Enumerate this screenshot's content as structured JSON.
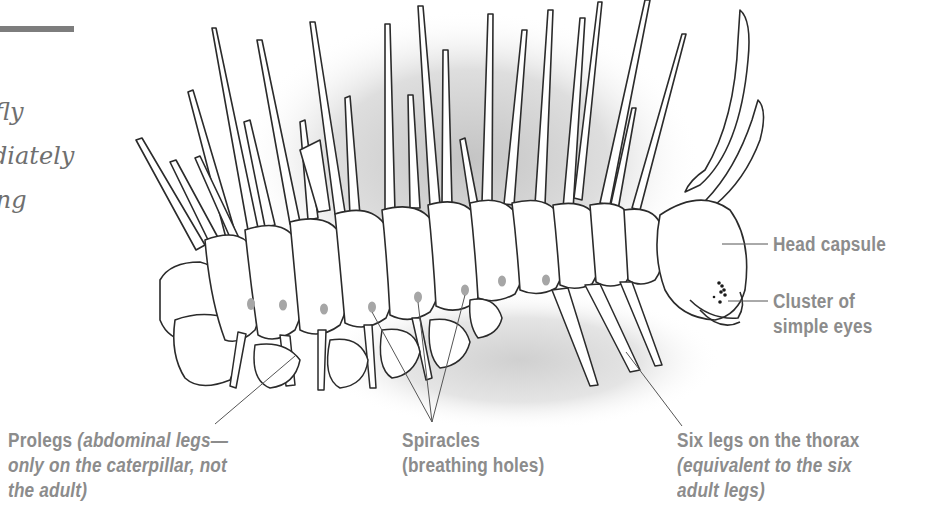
{
  "intro_fragment": {
    "lines": [
      "fly",
      "diately",
      "ing"
    ]
  },
  "diagram": {
    "subject": "caterpillar",
    "line_color": "#2b2b2b",
    "label_color": "#8c8c8c",
    "spiracle_color": "#a6a6a6",
    "shadow_color": "#cfcfcf"
  },
  "labels": {
    "head_capsule": "Head capsule",
    "eyes": {
      "line1": "Cluster of",
      "line2": "simple eyes"
    },
    "prolegs": {
      "title": "Prolegs",
      "line1_italic": "(abdominal legs—",
      "line2_italic": "only on the caterpillar, not",
      "line3_italic": "the adult)"
    },
    "spiracles": {
      "title": "Spiracles",
      "subtitle": "(breathing holes)"
    },
    "thorax_legs": {
      "title": "Six legs on the thorax",
      "line2_italic": "(equivalent to the six",
      "line3_italic": "adult legs)"
    }
  }
}
